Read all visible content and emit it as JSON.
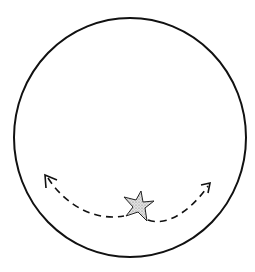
{
  "diagram": {
    "colors": {
      "stroke": "#111111",
      "background": "#ffffff",
      "star_fill": "#c8c8c8"
    },
    "elements": {
      "boundary": {
        "shape": "circle",
        "cx": 130,
        "cy": 137.5,
        "rx": 116,
        "ry": 119.5
      },
      "star": {
        "shape": "five-point-star",
        "cx": 136,
        "cy": 207
      },
      "path": {
        "style": "dashed",
        "arrows": [
          "left",
          "right"
        ]
      }
    }
  }
}
